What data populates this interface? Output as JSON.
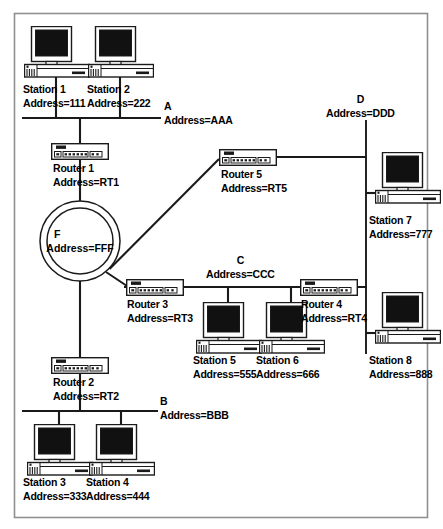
{
  "diagram": {
    "type": "network-topology",
    "colors": {
      "line": "#1a1a1a",
      "screen": "#111111",
      "border": "#888888",
      "fill": "#ffffff"
    },
    "border": {
      "x": 14,
      "y": 13,
      "w": 414,
      "h": 505
    },
    "networks": [
      {
        "id": "A",
        "name": "A",
        "address": "Address=AAA",
        "orientation": "horizontal",
        "label_x": 164,
        "label_y": 101,
        "x1": 22,
        "y1": 118,
        "x2": 161,
        "y2": 118
      },
      {
        "id": "B",
        "name": "B",
        "address": "Address=BBB",
        "orientation": "horizontal",
        "label_x": 160,
        "label_y": 396,
        "x1": 22,
        "y1": 411,
        "x2": 158,
        "y2": 411
      },
      {
        "id": "C",
        "name": "C",
        "address": "Address=CCC",
        "orientation": "horizontal",
        "label_x": 206,
        "label_y": 255,
        "x1": 124,
        "y1": 287,
        "x2": 367,
        "y2": 287
      },
      {
        "id": "D",
        "name": "D",
        "address": "Address=DDD",
        "orientation": "vertical",
        "label_x": 326,
        "label_y": 94,
        "x1": 366,
        "y1": 120,
        "x2": 366,
        "y2": 354
      },
      {
        "id": "F",
        "name": "F",
        "address": "Address=FFF",
        "orientation": "ring",
        "cx": 80,
        "cy": 241,
        "r_outer": 40,
        "r_inner": 33
      }
    ],
    "stations": [
      {
        "id": "station1",
        "name": "Station 1",
        "address": "Address=111",
        "icon_x": 24,
        "icon_y": 26,
        "label_x": 23,
        "label_y": 84,
        "stem_x": 56,
        "stem_y1": 76,
        "stem_y2": 118
      },
      {
        "id": "station2",
        "name": "Station 2",
        "address": "Address=222",
        "icon_x": 88,
        "icon_y": 26,
        "label_x": 87,
        "label_y": 84,
        "stem_x": 120,
        "stem_y1": 76,
        "stem_y2": 118
      },
      {
        "id": "station3",
        "name": "Station 3",
        "address": "Address=333",
        "icon_x": 27,
        "icon_y": 418,
        "label_x": 23,
        "label_y": 477,
        "stem_x": 59,
        "stem_y1": 411,
        "stem_y2": 423
      },
      {
        "id": "station4",
        "name": "Station 4",
        "address": "Address=444",
        "icon_x": 89,
        "icon_y": 418,
        "label_x": 86,
        "label_y": 477,
        "stem_x": 121,
        "stem_y1": 411,
        "stem_y2": 423
      },
      {
        "id": "station5",
        "name": "Station 5",
        "address": "Address=555",
        "icon_x": 196,
        "icon_y": 296,
        "label_x": 193,
        "label_y": 355,
        "stem_x": 228,
        "stem_y1": 287,
        "stem_y2": 301
      },
      {
        "id": "station6",
        "name": "Station 6",
        "address": "Address=666",
        "icon_x": 259,
        "icon_y": 296,
        "label_x": 256,
        "label_y": 355,
        "stem_x": 291,
        "stem_y1": 287,
        "stem_y2": 301
      },
      {
        "id": "station7",
        "name": "Station 7",
        "address": "Address=777",
        "icon_x": 375,
        "icon_y": 157,
        "label_x": 369,
        "label_y": 215,
        "stem_x1": 366,
        "stem_x2": 379,
        "stem_y": 194
      },
      {
        "id": "station8",
        "name": "Station 8",
        "address": "Address=888",
        "icon_x": 375,
        "icon_y": 297,
        "label_x": 369,
        "label_y": 355,
        "stem_x1": 366,
        "stem_x2": 379,
        "stem_y": 334
      }
    ],
    "routers": [
      {
        "id": "router1",
        "name": "Router 1",
        "address": "Address=RT1",
        "icon_x": 51,
        "icon_y": 143,
        "label_x": 53,
        "label_y": 163
      },
      {
        "id": "router2",
        "name": "Router 2",
        "address": "Address=RT2",
        "icon_x": 51,
        "icon_y": 357,
        "label_x": 53,
        "label_y": 377
      },
      {
        "id": "router3",
        "name": "Router 3",
        "address": "Address=RT3",
        "icon_x": 125,
        "icon_y": 279,
        "label_x": 127,
        "label_y": 299
      },
      {
        "id": "router4",
        "name": "Router 4",
        "address": "Address=RT4",
        "icon_x": 299,
        "icon_y": 279,
        "label_x": 301,
        "label_y": 299
      },
      {
        "id": "router5",
        "name": "Router 5",
        "address": "Address=RT5",
        "icon_x": 219,
        "icon_y": 149,
        "label_x": 221,
        "label_y": 169
      }
    ],
    "links": [
      {
        "from": "bus-A",
        "to": "router1",
        "path": "M 80 118 L 80 143"
      },
      {
        "from": "router1",
        "to": "ring-F",
        "path": "M 80 160 L 80 201"
      },
      {
        "from": "ring-F",
        "to": "router2",
        "path": "M 80 281 L 80 357"
      },
      {
        "from": "router2",
        "to": "bus-B",
        "path": "M 80 374 L 80 411"
      },
      {
        "from": "ring-F",
        "to": "router5",
        "path": "M 109 270 L 219 160"
      },
      {
        "from": "ring-F",
        "to": "router3",
        "path": "M 106 273 L 126 287"
      },
      {
        "from": "router5",
        "to": "bus-D",
        "path": "M 252 157 L 366 157"
      },
      {
        "from": "router4",
        "to": "bus-D",
        "path": "M 332 287 L 366 287"
      }
    ]
  }
}
